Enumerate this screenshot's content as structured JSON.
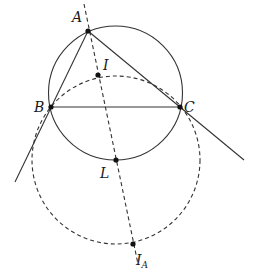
{
  "diagram": {
    "stroke_color": "#333333",
    "points": [
      {
        "id": "A",
        "label": "A",
        "x": 88,
        "y": 31,
        "lx": 72,
        "ly": 22
      },
      {
        "id": "B",
        "label": "B",
        "x": 51,
        "y": 107,
        "lx": 34,
        "ly": 112
      },
      {
        "id": "C",
        "label": "C",
        "x": 180,
        "y": 107,
        "lx": 184,
        "ly": 112
      },
      {
        "id": "I",
        "label": "I",
        "x": 98,
        "y": 75,
        "lx": 103,
        "ly": 70
      },
      {
        "id": "L",
        "label": "L",
        "x": 116,
        "y": 160,
        "lx": 100,
        "ly": 178
      },
      {
        "id": "IA",
        "label": "I",
        "sub": "A",
        "x": 133,
        "y": 244,
        "lx": 136,
        "ly": 265
      }
    ],
    "circles": [
      {
        "id": "circumcircle",
        "cx": 115.5,
        "cy": 93,
        "r": 67,
        "style": "solid"
      },
      {
        "id": "circle-L",
        "cx": 116,
        "cy": 160,
        "r": 84,
        "style": "dashed"
      }
    ],
    "segments": [
      {
        "id": "line-AB",
        "x1": 88,
        "y1": 31,
        "x2": 15,
        "y2": 182,
        "style": "solid"
      },
      {
        "id": "line-AC",
        "x1": 88,
        "y1": 31,
        "x2": 244,
        "y2": 160,
        "style": "solid"
      },
      {
        "id": "segment-BC",
        "x1": 51,
        "y1": 107,
        "x2": 180,
        "y2": 107,
        "style": "solid"
      },
      {
        "id": "angle-bisector-A",
        "x1": 84,
        "y1": 4,
        "x2": 138,
        "y2": 264,
        "style": "dashed"
      }
    ]
  }
}
